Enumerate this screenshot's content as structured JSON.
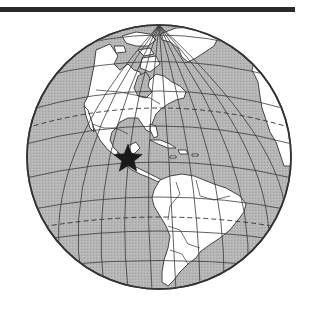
{
  "figure": {
    "type": "orthographic-globe",
    "colors": {
      "ocean": "#b3b3b3",
      "land": "#ffffff",
      "outline": "#333333",
      "graticule": "#3a3a3a",
      "marker": "#1a1a1a",
      "rule": "#2a2a2a"
    },
    "globe": {
      "cx": 159,
      "cy": 157,
      "r": 132
    },
    "marker": {
      "shape": "star",
      "icon": "star-icon",
      "cx": 128,
      "cy": 159,
      "outer_r": 15,
      "inner_r": 6.5,
      "location": "Central America"
    },
    "dashed_lines": [
      "Tropic of Cancer",
      "Tropic of Capricorn"
    ]
  }
}
